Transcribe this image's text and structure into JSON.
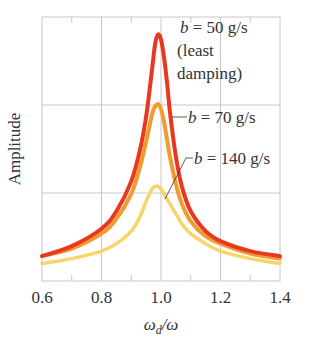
{
  "chart_data": {
    "type": "line",
    "title": "",
    "xlabel": "ωd/ω",
    "xlabel_main": "ω",
    "xlabel_sub": "d",
    "xlabel_tail": "/ω",
    "ylabel": "Amplitude",
    "xlim": [
      0.6,
      1.4
    ],
    "ylim": [
      0,
      1
    ],
    "x_ticks": [
      "0.6",
      "0.8",
      "1.0",
      "1.2",
      "1.4"
    ],
    "x_tick_values": [
      0.6,
      0.8,
      1.0,
      1.2,
      1.4
    ],
    "grid": true,
    "series": [
      {
        "name": "b = 50 g/s (least damping)",
        "label_var": "b",
        "label_value": "= 50 g/s",
        "label_line2": "(least",
        "label_line3": "damping)",
        "color": "#e8391e",
        "x": [
          0.6,
          0.7,
          0.8,
          0.85,
          0.9,
          0.93,
          0.95,
          0.97,
          0.98,
          0.99,
          1.0,
          1.01,
          1.02,
          1.03,
          1.05,
          1.07,
          1.1,
          1.15,
          1.2,
          1.3,
          1.4
        ],
        "y": [
          0.1,
          0.14,
          0.21,
          0.28,
          0.4,
          0.53,
          0.66,
          0.85,
          0.95,
          0.99,
          0.97,
          0.9,
          0.8,
          0.68,
          0.5,
          0.38,
          0.28,
          0.2,
          0.16,
          0.12,
          0.1
        ]
      },
      {
        "name": "b = 70 g/s",
        "label_var": "b",
        "label_value": "= 70 g/s",
        "color": "#f29a2e",
        "x": [
          0.6,
          0.7,
          0.8,
          0.85,
          0.9,
          0.93,
          0.95,
          0.97,
          0.98,
          0.99,
          1.0,
          1.01,
          1.02,
          1.03,
          1.05,
          1.07,
          1.1,
          1.15,
          1.2,
          1.3,
          1.4
        ],
        "y": [
          0.1,
          0.13,
          0.19,
          0.25,
          0.35,
          0.46,
          0.56,
          0.67,
          0.7,
          0.71,
          0.69,
          0.64,
          0.57,
          0.5,
          0.39,
          0.31,
          0.24,
          0.18,
          0.15,
          0.11,
          0.09
        ]
      },
      {
        "name": "b = 140 g/s",
        "label_var": "b",
        "label_value": "= 140 g/s",
        "color": "#f8d46a",
        "x": [
          0.6,
          0.7,
          0.8,
          0.85,
          0.9,
          0.93,
          0.95,
          0.97,
          0.98,
          0.99,
          1.0,
          1.01,
          1.02,
          1.03,
          1.05,
          1.07,
          1.1,
          1.15,
          1.2,
          1.3,
          1.4
        ],
        "y": [
          0.07,
          0.09,
          0.12,
          0.15,
          0.2,
          0.26,
          0.32,
          0.37,
          0.38,
          0.38,
          0.37,
          0.35,
          0.33,
          0.31,
          0.27,
          0.23,
          0.19,
          0.15,
          0.12,
          0.09,
          0.07
        ]
      }
    ]
  },
  "layout": {
    "plot_left": 42,
    "plot_right": 280,
    "plot_top": 17,
    "plot_bottom": 281,
    "hgrid_y": [
      105,
      193
    ],
    "grid_color": "#c8c8c8"
  }
}
